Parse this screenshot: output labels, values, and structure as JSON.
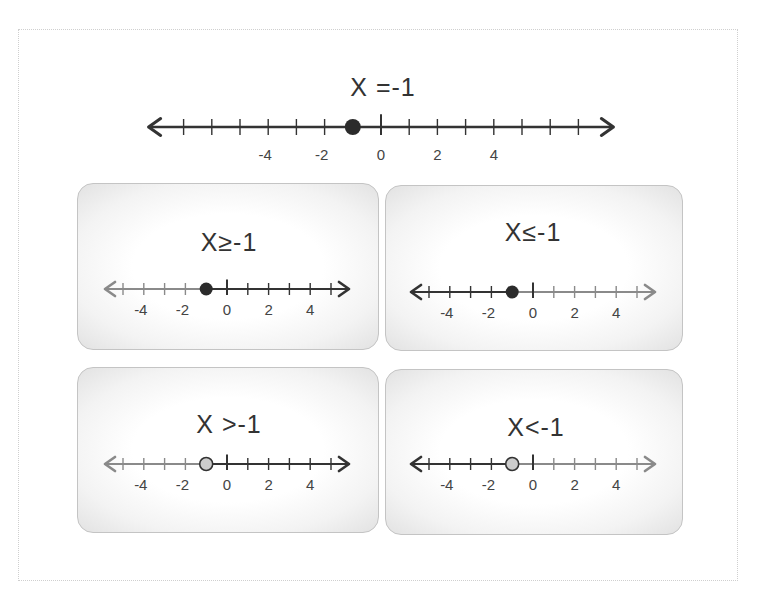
{
  "diagram": {
    "main": {
      "title": "X =-1",
      "point": -1,
      "point_style": "closed",
      "shaded": "none",
      "range": [
        -7,
        7
      ],
      "labeled_ticks": [
        "-4",
        "-2",
        "0",
        "2",
        "4"
      ]
    },
    "panels": [
      {
        "id": "ge",
        "title": "X≥-1",
        "point": -1,
        "point_style": "closed",
        "shaded": "right",
        "range": [
          -5,
          5
        ],
        "labeled_ticks": [
          "-4",
          "-2",
          "0",
          "2",
          "4"
        ]
      },
      {
        "id": "le",
        "title": "X≤-1",
        "point": -1,
        "point_style": "closed",
        "shaded": "left",
        "range": [
          -5,
          5
        ],
        "labeled_ticks": [
          "-4",
          "-2",
          "0",
          "2",
          "4"
        ]
      },
      {
        "id": "gt",
        "title": "X >-1",
        "point": -1,
        "point_style": "open",
        "shaded": "right",
        "range": [
          -5,
          5
        ],
        "labeled_ticks": [
          "-4",
          "-2",
          "0",
          "2",
          "4"
        ]
      },
      {
        "id": "lt",
        "title": "X<-1",
        "point": -1,
        "point_style": "open",
        "shaded": "left",
        "range": [
          -5,
          5
        ],
        "labeled_ticks": [
          "-4",
          "-2",
          "0",
          "2",
          "4"
        ]
      }
    ],
    "colors": {
      "line_dark": "#333333",
      "line_light": "#8a8a8a",
      "closed_point": "#2b2b2b",
      "open_point_fill": "#cccccc"
    }
  }
}
